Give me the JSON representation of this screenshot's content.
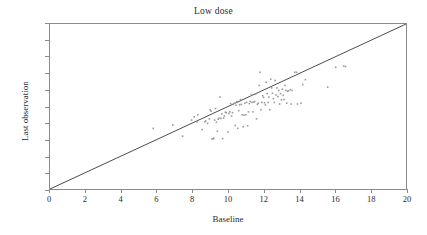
{
  "chart_data": {
    "type": "scatter",
    "title": "Low dose",
    "xlabel": "Baseline",
    "ylabel": "Last observation",
    "xlim": [
      0,
      20
    ],
    "ylim": [
      0,
      20
    ],
    "xticks": [
      0,
      2,
      4,
      6,
      8,
      10,
      12,
      14,
      16,
      18,
      20
    ],
    "yticks": [
      0,
      2,
      4,
      6,
      8,
      10,
      12,
      14,
      16,
      18,
      20
    ],
    "grid": false,
    "legend": null,
    "reference_line": {
      "name": "identity-line",
      "from": [
        0,
        0
      ],
      "to": [
        20,
        20
      ],
      "color": "#4a4a4a"
    },
    "marker": {
      "shape": "square",
      "size_px": 1.6,
      "color": "#9a9a9a"
    },
    "points": [
      [
        5.8,
        7.35
      ],
      [
        6.9,
        7.75
      ],
      [
        7.45,
        6.4
      ],
      [
        7.95,
        8.35
      ],
      [
        8.1,
        8.75
      ],
      [
        8.25,
        8.15
      ],
      [
        8.3,
        9.0
      ],
      [
        8.55,
        7.2
      ],
      [
        8.7,
        8.15
      ],
      [
        8.75,
        8.25
      ],
      [
        8.85,
        7.95
      ],
      [
        8.95,
        8.5
      ],
      [
        9.0,
        9.6
      ],
      [
        9.05,
        9.45
      ],
      [
        9.1,
        6.1
      ],
      [
        9.15,
        6.05
      ],
      [
        9.2,
        6.15
      ],
      [
        9.25,
        8.35
      ],
      [
        9.3,
        9.75
      ],
      [
        9.35,
        8.1
      ],
      [
        9.4,
        7.0
      ],
      [
        9.45,
        8.45
      ],
      [
        9.5,
        8.6
      ],
      [
        9.55,
        11.15
      ],
      [
        9.6,
        8.55
      ],
      [
        9.65,
        9.1
      ],
      [
        9.7,
        6.1
      ],
      [
        9.75,
        8.6
      ],
      [
        9.8,
        8.85
      ],
      [
        9.85,
        9.3
      ],
      [
        9.9,
        9.25
      ],
      [
        10.0,
        6.9
      ],
      [
        10.05,
        9.15
      ],
      [
        10.1,
        9.35
      ],
      [
        10.15,
        10.35
      ],
      [
        10.2,
        8.85
      ],
      [
        10.25,
        9.25
      ],
      [
        10.3,
        10.25
      ],
      [
        10.35,
        10.4
      ],
      [
        10.4,
        7.7
      ],
      [
        10.45,
        10.15
      ],
      [
        10.5,
        10.6
      ],
      [
        10.55,
        7.35
      ],
      [
        10.6,
        9.5
      ],
      [
        10.65,
        10.2
      ],
      [
        10.7,
        10.85
      ],
      [
        10.75,
        10.25
      ],
      [
        10.8,
        9.0
      ],
      [
        10.85,
        7.55
      ],
      [
        10.9,
        8.95
      ],
      [
        10.95,
        10.4
      ],
      [
        11.0,
        9.0
      ],
      [
        11.05,
        10.5
      ],
      [
        11.1,
        7.65
      ],
      [
        11.15,
        9.35
      ],
      [
        11.2,
        10.35
      ],
      [
        11.25,
        10.6
      ],
      [
        11.3,
        11.4
      ],
      [
        11.35,
        10.5
      ],
      [
        11.4,
        9.35
      ],
      [
        11.45,
        10.55
      ],
      [
        11.5,
        10.6
      ],
      [
        11.55,
        11.5
      ],
      [
        11.6,
        8.5
      ],
      [
        11.65,
        10.25
      ],
      [
        11.7,
        10.4
      ],
      [
        11.75,
        12.55
      ],
      [
        11.8,
        14.15
      ],
      [
        11.85,
        9.6
      ],
      [
        11.9,
        10.5
      ],
      [
        11.95,
        11.3
      ],
      [
        12.0,
        11.1
      ],
      [
        12.05,
        10.45
      ],
      [
        12.1,
        10.2
      ],
      [
        12.15,
        12.95
      ],
      [
        12.2,
        11.55
      ],
      [
        12.25,
        10.5
      ],
      [
        12.3,
        11.15
      ],
      [
        12.35,
        9.6
      ],
      [
        12.4,
        13.3
      ],
      [
        12.45,
        12.25
      ],
      [
        12.5,
        11.6
      ],
      [
        12.55,
        10.95
      ],
      [
        12.6,
        10.5
      ],
      [
        12.65,
        13.15
      ],
      [
        12.7,
        11.4
      ],
      [
        12.75,
        12.25
      ],
      [
        12.8,
        11.2
      ],
      [
        12.85,
        11.95
      ],
      [
        12.9,
        10.3
      ],
      [
        12.95,
        11.55
      ],
      [
        13.0,
        10.8
      ],
      [
        13.05,
        12.1
      ],
      [
        13.1,
        11.35
      ],
      [
        13.15,
        10.85
      ],
      [
        13.2,
        12.55
      ],
      [
        13.25,
        11.95
      ],
      [
        13.3,
        10.4
      ],
      [
        13.35,
        11.85
      ],
      [
        13.4,
        11.9
      ],
      [
        13.5,
        12.05
      ],
      [
        13.55,
        10.3
      ],
      [
        13.6,
        11.95
      ],
      [
        13.75,
        14.15
      ],
      [
        13.85,
        14.15
      ],
      [
        13.9,
        10.3
      ],
      [
        14.1,
        10.4
      ],
      [
        14.2,
        12.65
      ],
      [
        14.35,
        13.25
      ],
      [
        15.6,
        12.35
      ],
      [
        16.05,
        14.75
      ],
      [
        16.5,
        14.9
      ],
      [
        16.6,
        14.85
      ]
    ]
  }
}
